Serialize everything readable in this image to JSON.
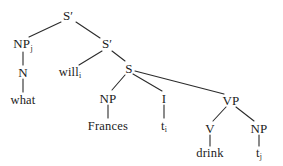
{
  "figure": {
    "type": "syntax-tree",
    "background_color": "#ffffff",
    "line_color": "#2b2b2b",
    "text_color": "#1b1b1b"
  },
  "nodes": {
    "root_sbar": {
      "label": "S",
      "prime": "′",
      "x": 68,
      "y": 16
    },
    "np_wh": {
      "label": "NP",
      "subscript": "j",
      "x": 23,
      "y": 44
    },
    "n_wh": {
      "label": "N",
      "x": 23,
      "y": 72
    },
    "what": {
      "label": "what",
      "x": 23,
      "y": 100
    },
    "inner_sbar": {
      "label": "S",
      "prime": "′",
      "x": 107,
      "y": 44
    },
    "will": {
      "label": "will",
      "subscript": "i",
      "x": 70,
      "y": 72
    },
    "s": {
      "label": "S",
      "x": 129,
      "y": 68
    },
    "np_subj": {
      "label": "NP",
      "x": 108,
      "y": 98
    },
    "frances": {
      "label": "Frances",
      "x": 108,
      "y": 126
    },
    "infl": {
      "label": "I",
      "x": 164,
      "y": 98
    },
    "trace_i": {
      "label": "t",
      "subscript": "i",
      "x": 164,
      "y": 126
    },
    "vp": {
      "label": "VP",
      "x": 231,
      "y": 100
    },
    "v": {
      "label": "V",
      "x": 210,
      "y": 128
    },
    "drink": {
      "label": "drink",
      "x": 210,
      "y": 153
    },
    "np_obj": {
      "label": "NP",
      "x": 259,
      "y": 128
    },
    "trace_j": {
      "label": "t",
      "subscript": "j",
      "x": 259,
      "y": 153
    }
  },
  "edges": [
    {
      "name": "root-to-np-wh",
      "x1": 61,
      "y1": 22,
      "x2": 29,
      "y2": 37
    },
    {
      "name": "root-to-inner-sbar",
      "x1": 76,
      "y1": 22,
      "x2": 100,
      "y2": 38
    },
    {
      "name": "np-wh-to-n",
      "x1": 23,
      "y1": 52,
      "x2": 23,
      "y2": 65
    },
    {
      "name": "n-to-what",
      "x1": 23,
      "y1": 79,
      "x2": 23,
      "y2": 92
    },
    {
      "name": "inner-sbar-to-will",
      "x1": 102,
      "y1": 51,
      "x2": 79,
      "y2": 65
    },
    {
      "name": "inner-sbar-to-s",
      "x1": 112,
      "y1": 51,
      "x2": 125,
      "y2": 61
    },
    {
      "name": "s-to-np-subj",
      "x1": 125,
      "y1": 75,
      "x2": 112,
      "y2": 90
    },
    {
      "name": "s-to-infl",
      "x1": 133,
      "y1": 74,
      "x2": 162,
      "y2": 91
    },
    {
      "name": "s-to-vp",
      "x1": 135,
      "y1": 71,
      "x2": 224,
      "y2": 94
    },
    {
      "name": "np-subj-to-frances",
      "x1": 108,
      "y1": 105,
      "x2": 108,
      "y2": 118
    },
    {
      "name": "infl-to-trace-i",
      "x1": 164,
      "y1": 105,
      "x2": 164,
      "y2": 118
    },
    {
      "name": "vp-to-v",
      "x1": 226,
      "y1": 107,
      "x2": 213,
      "y2": 121
    },
    {
      "name": "vp-to-np-obj",
      "x1": 236,
      "y1": 107,
      "x2": 254,
      "y2": 121
    },
    {
      "name": "v-to-drink",
      "x1": 210,
      "y1": 135,
      "x2": 210,
      "y2": 146
    },
    {
      "name": "np-obj-to-trace-j",
      "x1": 259,
      "y1": 135,
      "x2": 259,
      "y2": 146
    }
  ]
}
